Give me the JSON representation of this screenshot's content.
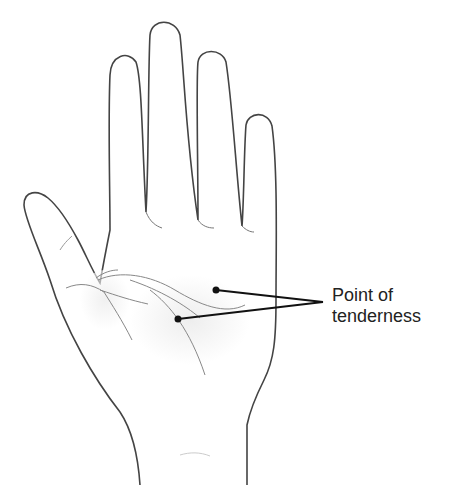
{
  "figure": {
    "type": "anatomical illustration",
    "annotation": {
      "label_line1": "Point of",
      "label_line2": "tenderness",
      "points": [
        {
          "x": 216,
          "y": 290
        },
        {
          "x": 178,
          "y": 319
        }
      ],
      "convergence": {
        "x": 323,
        "y": 302
      }
    },
    "colors": {
      "outline": "#444444",
      "crease": "#888888",
      "pointer": "#111111",
      "shading": "#e8e8e8"
    }
  }
}
